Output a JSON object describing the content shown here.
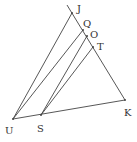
{
  "diagram": {
    "type": "geometry",
    "stroke_color": "#444444",
    "points": {
      "J": {
        "x": 72,
        "y": 13,
        "label": "J",
        "lx": 77,
        "ly": 12
      },
      "Q": {
        "x": 83,
        "y": 30,
        "label": "Q",
        "lx": 84,
        "ly": 27
      },
      "O": {
        "x": 87,
        "y": 36,
        "label": "O",
        "lx": 90,
        "ly": 38
      },
      "T": {
        "x": 93,
        "y": 47,
        "label": "T",
        "lx": 97,
        "ly": 50
      },
      "K": {
        "x": 125,
        "y": 100,
        "label": "K",
        "lx": 125,
        "ly": 115
      },
      "U": {
        "x": 13,
        "y": 119,
        "label": "U",
        "lx": 6,
        "ly": 133
      },
      "S": {
        "x": 41,
        "y": 115,
        "label": "S",
        "lx": 37,
        "ly": 132
      }
    },
    "segments": [
      [
        "top",
        "K"
      ],
      [
        "U",
        "K"
      ],
      [
        "U",
        "J"
      ],
      [
        "U",
        "Q"
      ],
      [
        "S",
        "O"
      ],
      [
        "S",
        "T"
      ]
    ]
  }
}
